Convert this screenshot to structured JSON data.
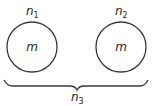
{
  "diagram": {
    "nodes": [
      {
        "id": "circle-1",
        "shape": "circle",
        "center_label": "m",
        "top_label": "n",
        "top_label_subscript": "1"
      },
      {
        "id": "circle-2",
        "shape": "circle",
        "center_label": "m",
        "top_label": "n",
        "top_label_subscript": "2"
      }
    ],
    "brace": {
      "label": "n",
      "label_subscript": "3",
      "spans": [
        "circle-1",
        "circle-2"
      ]
    },
    "colors": {
      "stroke": "#3a3a3a",
      "text": "#2a2a2a",
      "background": "#ffffff"
    }
  }
}
